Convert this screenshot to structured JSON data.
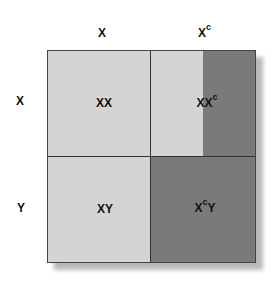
{
  "columns": [
    {
      "label": "X"
    },
    {
      "label": "X",
      "superscript": "c"
    }
  ],
  "rows": [
    {
      "label": "X"
    },
    {
      "label": "Y"
    }
  ],
  "cells": [
    {
      "label": "XX",
      "superscript": "",
      "suffix": ""
    },
    {
      "label": "XX",
      "superscript": "c",
      "suffix": ""
    },
    {
      "label": "XY",
      "superscript": "",
      "suffix": ""
    },
    {
      "label": "X",
      "superscript": "c",
      "suffix": "Y"
    }
  ],
  "colors": {
    "light_region": "#d4d4d4",
    "dark_region": "#7a7a7a",
    "border": "#333333"
  }
}
